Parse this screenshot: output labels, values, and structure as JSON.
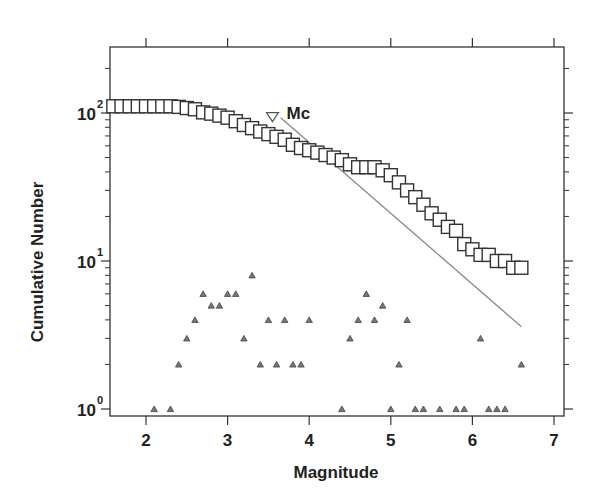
{
  "chart_data": {
    "type": "scatter",
    "title": "",
    "xlabel": "Magnitude",
    "ylabel": "Cumulative Number",
    "xlim": [
      1.55,
      7.1
    ],
    "ylim": [
      0.9,
      250
    ],
    "yscale": "log",
    "grid": false,
    "x_ticks": [
      "2",
      "3",
      "4",
      "5",
      "6",
      "7"
    ],
    "y_ticks": [
      "10^0",
      "10^1",
      "10^2"
    ],
    "annotation": {
      "text": "Mc",
      "x": 3.55,
      "y": 93,
      "marker": "inverted-triangle"
    },
    "series": [
      {
        "name": "Cumulative number",
        "marker": "open-square",
        "x": [
          1.6,
          1.7,
          1.8,
          1.9,
          2.0,
          2.1,
          2.2,
          2.3,
          2.4,
          2.5,
          2.6,
          2.7,
          2.8,
          2.9,
          3.0,
          3.1,
          3.2,
          3.3,
          3.4,
          3.5,
          3.6,
          3.7,
          3.8,
          3.9,
          4.0,
          4.1,
          4.2,
          4.3,
          4.4,
          4.5,
          4.6,
          4.7,
          4.8,
          4.9,
          5.0,
          5.1,
          5.2,
          5.3,
          5.4,
          5.5,
          5.6,
          5.7,
          5.8,
          5.9,
          6.0,
          6.1,
          6.2,
          6.3,
          6.4,
          6.5,
          6.6
        ],
        "y": [
          111,
          111,
          111,
          111,
          111,
          111,
          111,
          111,
          110,
          108,
          106,
          101,
          99,
          96,
          93,
          88,
          83,
          79,
          75,
          72,
          69,
          66,
          61,
          58,
          56,
          54,
          52,
          50,
          48,
          45,
          43,
          43,
          43,
          41,
          38,
          34,
          30,
          27,
          24,
          21,
          19,
          17,
          16,
          13,
          12,
          11,
          11,
          10,
          10,
          9,
          9
        ]
      },
      {
        "name": "Non-cumulative number",
        "marker": "small-filled-triangle",
        "x": [
          2.1,
          2.3,
          2.4,
          2.5,
          2.6,
          2.7,
          2.8,
          2.9,
          3.0,
          3.1,
          3.2,
          3.3,
          3.4,
          3.5,
          3.6,
          3.7,
          3.8,
          3.9,
          4.0,
          4.4,
          4.5,
          4.6,
          4.7,
          4.8,
          4.9,
          5.0,
          5.1,
          5.2,
          5.3,
          5.4,
          5.6,
          5.8,
          5.9,
          6.1,
          6.2,
          6.3,
          6.4,
          6.6
        ],
        "y": [
          1,
          1,
          2,
          3,
          4,
          6,
          5,
          5,
          6,
          6,
          3,
          8,
          2,
          4,
          2,
          4,
          2,
          2,
          4,
          1,
          3,
          4,
          6,
          4,
          5,
          1,
          2,
          4,
          1,
          1,
          1,
          1,
          1,
          3,
          1,
          1,
          1,
          2
        ]
      },
      {
        "name": "Fit line",
        "marker": "line",
        "x": [
          3.65,
          6.6
        ],
        "y": [
          93,
          3.6
        ]
      }
    ]
  }
}
